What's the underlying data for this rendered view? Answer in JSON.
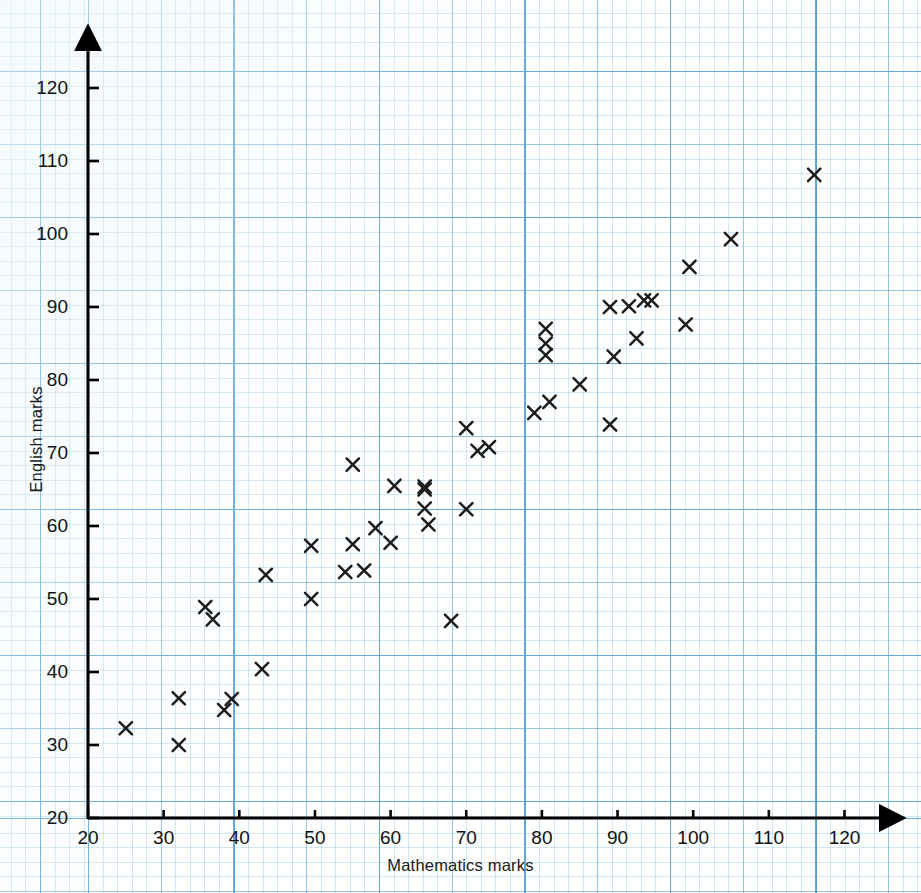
{
  "chart_data": {
    "type": "scatter",
    "title": "",
    "xlabel": "Mathematics marks",
    "ylabel": "English marks",
    "xlim": [
      20,
      125
    ],
    "ylim": [
      20,
      125
    ],
    "xticks": [
      20,
      30,
      40,
      50,
      60,
      70,
      80,
      90,
      100,
      110,
      120
    ],
    "yticks": [
      20,
      30,
      40,
      50,
      60,
      70,
      80,
      90,
      100,
      110,
      120
    ],
    "grid": "graph-paper",
    "legend": "none",
    "marker": "x",
    "marker_color": "#1d1d1d",
    "grid_color": "#3a91cd",
    "axis_color": "#000000",
    "points": [
      [
        25,
        32.3
      ],
      [
        32,
        36.4
      ],
      [
        32,
        30.0
      ],
      [
        35.5,
        48.9
      ],
      [
        36.5,
        47.2
      ],
      [
        38,
        34.8
      ],
      [
        39,
        36.3
      ],
      [
        43,
        40.4
      ],
      [
        43.5,
        53.3
      ],
      [
        49.5,
        50.0
      ],
      [
        49.5,
        57.3
      ],
      [
        54,
        53.7
      ],
      [
        55,
        57.5
      ],
      [
        55,
        68.4
      ],
      [
        56.5,
        53.9
      ],
      [
        58,
        59.7
      ],
      [
        60,
        57.7
      ],
      [
        60.5,
        65.5
      ],
      [
        64.5,
        65.4
      ],
      [
        64.5,
        65.0
      ],
      [
        64.5,
        62.4
      ],
      [
        65,
        60.2
      ],
      [
        68,
        47.0
      ],
      [
        70,
        62.3
      ],
      [
        70,
        73.4
      ],
      [
        71.5,
        70.3
      ],
      [
        73,
        70.8
      ],
      [
        79,
        75.5
      ],
      [
        80.5,
        87.0
      ],
      [
        80.5,
        85.0
      ],
      [
        80.5,
        83.4
      ],
      [
        81,
        77.0
      ],
      [
        85,
        79.4
      ],
      [
        89,
        90.0
      ],
      [
        89,
        73.9
      ],
      [
        89.5,
        83.2
      ],
      [
        91.5,
        90.1
      ],
      [
        92.5,
        85.7
      ],
      [
        93.5,
        90.9
      ],
      [
        94.5,
        90.9
      ],
      [
        99,
        87.6
      ],
      [
        99.5,
        95.5
      ],
      [
        105,
        99.3
      ],
      [
        116,
        108.1
      ]
    ],
    "n_points": 44
  },
  "axes": {
    "x_tick_labels": [
      "20",
      "30",
      "40",
      "50",
      "60",
      "70",
      "80",
      "90",
      "100",
      "110",
      "120"
    ],
    "y_tick_labels": [
      "20",
      "30",
      "40",
      "50",
      "60",
      "70",
      "80",
      "90",
      "100",
      "110",
      "120"
    ],
    "x_axis_title": "Mathematics marks",
    "y_axis_title": "English marks"
  }
}
